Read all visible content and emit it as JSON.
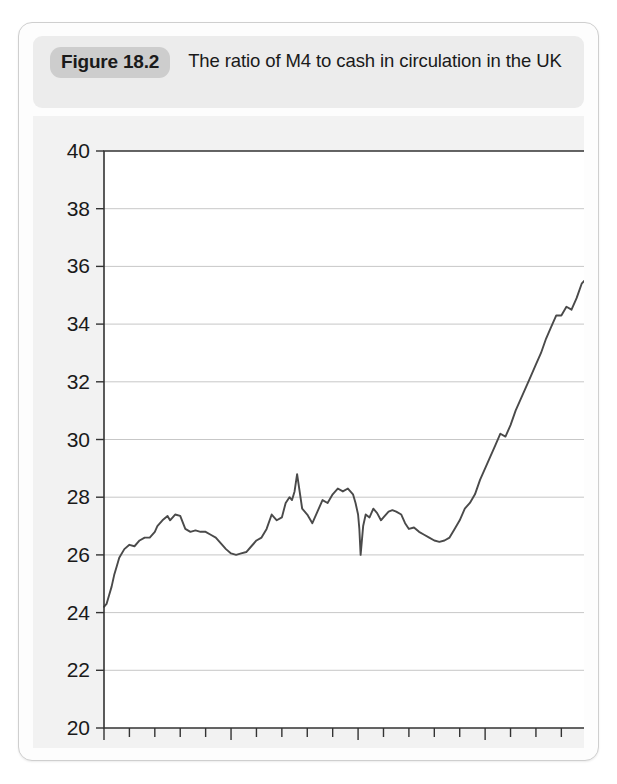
{
  "figure": {
    "badge": "Figure 18.2",
    "title": "The ratio of M4 to cash in circulation in the UK"
  },
  "colors": {
    "card_background": "#fdfdfd",
    "card_border": "#cfcfcf",
    "header_background": "#ececec",
    "badge_background": "#cdcdcd",
    "plot_background": "#ffffff",
    "plot_surround": "#f2f2f2",
    "axis": "#333333",
    "gridline": "#b9b9b9",
    "series": "#4a4a4a",
    "text": "#1a1a1a"
  },
  "chart_data": {
    "type": "line",
    "title": "The ratio of M4 to cash in circulation in the UK",
    "xlabel": "",
    "ylabel": "",
    "xlim": [
      1990,
      2009.6
    ],
    "ylim": [
      20,
      40
    ],
    "grid": true,
    "legend": null,
    "y_ticks": [
      20,
      22,
      24,
      26,
      28,
      30,
      32,
      34,
      36,
      38,
      40
    ],
    "y_tick_labels": [
      "20",
      "22",
      "24",
      "26",
      "28",
      "30",
      "32",
      "34",
      "36",
      "38",
      "40"
    ],
    "x_ticks": [
      1990,
      1991,
      1992,
      1993,
      1994,
      1995,
      1996,
      1997,
      1998,
      1999,
      2000,
      2001,
      2002,
      2003,
      2004,
      2005,
      2006,
      2007,
      2008,
      2009
    ],
    "x_tick_labels": [
      "1990",
      "",
      "",
      "",
      "",
      "1995",
      "",
      "",
      "",
      "",
      "2000",
      "",
      "",
      "",
      "",
      "2005",
      "",
      "",
      "",
      ""
    ],
    "x_labeled_ticks": [
      1990,
      1995,
      2000,
      2005
    ],
    "series": [
      {
        "name": "M4 to cash ratio",
        "color": "#4a4a4a",
        "x": [
          1990.0,
          1990.1,
          1990.2,
          1990.3,
          1990.4,
          1990.5,
          1990.6,
          1990.8,
          1991.0,
          1991.2,
          1991.4,
          1991.6,
          1991.8,
          1992.0,
          1992.1,
          1992.3,
          1992.5,
          1992.6,
          1992.8,
          1993.0,
          1993.2,
          1993.4,
          1993.6,
          1993.8,
          1994.0,
          1994.2,
          1994.4,
          1994.6,
          1994.8,
          1995.0,
          1995.2,
          1995.4,
          1995.6,
          1995.8,
          1996.0,
          1996.2,
          1996.4,
          1996.6,
          1996.8,
          1997.0,
          1997.15,
          1997.3,
          1997.4,
          1997.5,
          1997.6,
          1997.8,
          1998.0,
          1998.2,
          1998.4,
          1998.6,
          1998.8,
          1999.0,
          1999.2,
          1999.4,
          1999.6,
          1999.8,
          1999.9,
          2000.0,
          2000.05,
          2000.1,
          2000.2,
          2000.3,
          2000.45,
          2000.6,
          2000.75,
          2000.9,
          2001.0,
          2001.2,
          2001.35,
          2001.5,
          2001.7,
          2001.85,
          2002.0,
          2002.2,
          2002.4,
          2002.6,
          2002.8,
          2003.0,
          2003.2,
          2003.4,
          2003.6,
          2003.8,
          2004.0,
          2004.2,
          2004.4,
          2004.6,
          2004.8,
          2005.0,
          2005.2,
          2005.4,
          2005.6,
          2005.8,
          2006.0,
          2006.2,
          2006.4,
          2006.6,
          2006.8,
          2007.0,
          2007.2,
          2007.4,
          2007.6,
          2007.8,
          2008.0,
          2008.2,
          2008.4,
          2008.6,
          2008.8,
          2009.0,
          2009.2,
          2009.4,
          2009.5
        ],
        "y": [
          24.2,
          24.3,
          24.6,
          24.9,
          25.3,
          25.6,
          25.9,
          26.2,
          26.35,
          26.3,
          26.5,
          26.6,
          26.6,
          26.8,
          27.0,
          27.2,
          27.35,
          27.2,
          27.4,
          27.35,
          26.9,
          26.8,
          26.85,
          26.8,
          26.8,
          26.7,
          26.6,
          26.4,
          26.2,
          26.05,
          26.0,
          26.05,
          26.1,
          26.3,
          26.5,
          26.6,
          26.9,
          27.4,
          27.2,
          27.3,
          27.8,
          28.0,
          27.9,
          28.2,
          28.8,
          27.6,
          27.4,
          27.1,
          27.5,
          27.9,
          27.8,
          28.1,
          28.3,
          28.2,
          28.3,
          28.1,
          27.8,
          27.4,
          26.9,
          26.0,
          27.0,
          27.4,
          27.3,
          27.6,
          27.45,
          27.2,
          27.3,
          27.5,
          27.55,
          27.5,
          27.4,
          27.1,
          26.9,
          26.95,
          26.8,
          26.7,
          26.6,
          26.5,
          26.45,
          26.5,
          26.6,
          26.9,
          27.2,
          27.6,
          27.8,
          28.1,
          28.6,
          29.0,
          29.4,
          29.8,
          30.2,
          30.1,
          30.5,
          31.0,
          31.4,
          31.8,
          32.2,
          32.6,
          33.0,
          33.5,
          33.9,
          34.3,
          34.3,
          34.6,
          34.5,
          34.9,
          35.4,
          35.6,
          36.2,
          36.9,
          37.2
        ]
      }
    ]
  }
}
